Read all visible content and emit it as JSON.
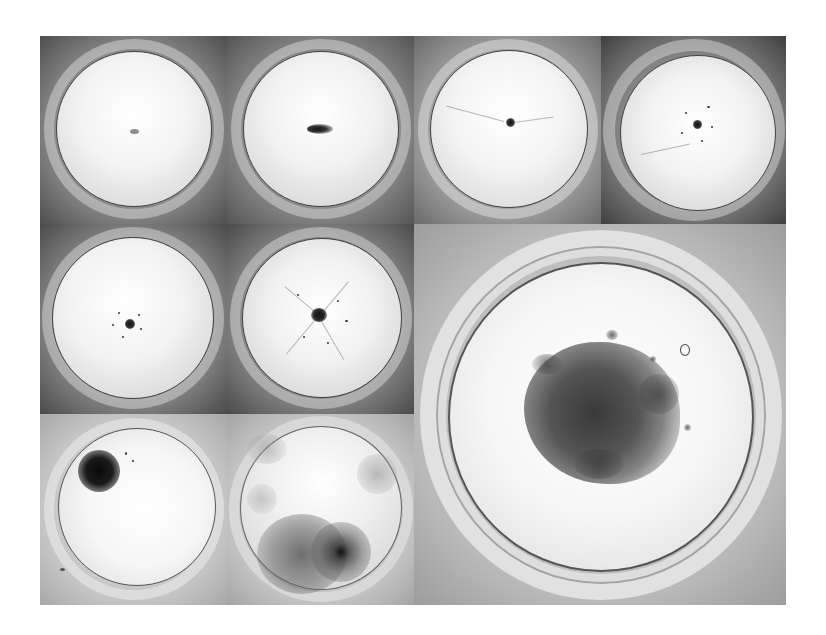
{
  "figure": {
    "layout": "montage",
    "grid": {
      "columns": 4,
      "rows": 3
    },
    "panels": [
      {
        "id": "p1",
        "row": 1,
        "col": 1,
        "content": "petri-dish",
        "colony": "tiny faint center speck",
        "tone": "dark-vignette"
      },
      {
        "id": "p2",
        "row": 1,
        "col": 2,
        "content": "petri-dish",
        "colony": "small elongated dark colony at center",
        "tone": "dark-vignette"
      },
      {
        "id": "p3",
        "row": 1,
        "col": 3,
        "content": "petri-dish",
        "colony": "small dark center colony with faint filaments",
        "tone": "medium"
      },
      {
        "id": "p4",
        "row": 1,
        "col": 4,
        "content": "petri-dish",
        "colony": "center colony with scattered satellite specks",
        "tone": "dark-vignette"
      },
      {
        "id": "p5",
        "row": 2,
        "col": 1,
        "content": "petri-dish",
        "colony": "center colony with radiating specks",
        "tone": "dark-vignette"
      },
      {
        "id": "p6",
        "row": 2,
        "col": 2,
        "content": "petri-dish",
        "colony": "larger center colony with radiating filaments",
        "tone": "dark-vignette"
      },
      {
        "id": "p7",
        "row": 2,
        "col": 3,
        "rowspan": 2,
        "colspan": 2,
        "content": "petri-dish",
        "colony": "large dense dendritic colony",
        "tone": "light"
      },
      {
        "id": "p8",
        "row": 3,
        "col": 1,
        "content": "petri-dish",
        "colony": "dense dark colony upper-left",
        "tone": "light"
      },
      {
        "id": "p9",
        "row": 3,
        "col": 2,
        "content": "petri-dish",
        "colony": "diffuse spreading colonies lower half",
        "tone": "light"
      }
    ]
  },
  "colors": {
    "page_background": "#ffffff",
    "dish_interior": "#f4f4f4",
    "dark_vignette": "#5a5a5a",
    "colony": "#2a2a2a"
  }
}
